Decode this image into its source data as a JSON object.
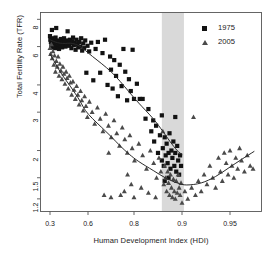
{
  "chart_data": {
    "type": "scatter",
    "title": "",
    "xlabel": "Human Development Index (HDI)",
    "ylabel": "Total Fertility Rate (TFR)",
    "x_ticks": [
      0.3,
      0.6,
      0.8,
      0.9,
      0.95
    ],
    "x_tick_labels": [
      "0.3",
      "0.6",
      "0.8",
      "0.9",
      "0.95"
    ],
    "y_ticks": [
      8,
      6,
      4,
      3,
      2,
      1.5,
      1.2
    ],
    "y_tick_labels": [
      "8",
      "6",
      "4",
      "3",
      "2",
      "1.5",
      "1.2"
    ],
    "y_scale": "log",
    "xlim": [
      0.26,
      0.98
    ],
    "ylim": [
      1.05,
      8.6
    ],
    "grid": false,
    "legend_position": "top-right",
    "highlight_band": {
      "label": "HDI 0.86 - 0.90 transition zone",
      "x_start": 0.858,
      "x_end": 0.902,
      "color": "#d9d9d9"
    },
    "series": [
      {
        "name": "1975",
        "marker": "square",
        "color": "#121212",
        "points": [
          [
            0.3,
            6.7
          ],
          [
            0.303,
            6.45
          ],
          [
            0.307,
            6.3
          ],
          [
            0.311,
            6.05
          ],
          [
            0.315,
            7.15
          ],
          [
            0.318,
            6.2
          ],
          [
            0.322,
            5.95
          ],
          [
            0.327,
            6.55
          ],
          [
            0.331,
            6.35
          ],
          [
            0.335,
            6.1
          ],
          [
            0.339,
            5.9
          ],
          [
            0.344,
            6.6
          ],
          [
            0.349,
            7.3
          ],
          [
            0.353,
            6.25
          ],
          [
            0.357,
            6.0
          ],
          [
            0.362,
            6.4
          ],
          [
            0.366,
            6.15
          ],
          [
            0.371,
            5.85
          ],
          [
            0.376,
            6.3
          ],
          [
            0.381,
            6.05
          ],
          [
            0.386,
            6.5
          ],
          [
            0.391,
            6.2
          ],
          [
            0.396,
            5.95
          ],
          [
            0.401,
            6.35
          ],
          [
            0.406,
            6.1
          ],
          [
            0.411,
            6.55
          ],
          [
            0.417,
            6.25
          ],
          [
            0.422,
            6.0
          ],
          [
            0.428,
            6.4
          ],
          [
            0.433,
            6.15
          ],
          [
            0.439,
            7.05
          ],
          [
            0.445,
            6.3
          ],
          [
            0.451,
            6.05
          ],
          [
            0.457,
            6.45
          ],
          [
            0.463,
            6.2
          ],
          [
            0.469,
            5.9
          ],
          [
            0.475,
            6.35
          ],
          [
            0.482,
            6.6
          ],
          [
            0.488,
            6.1
          ],
          [
            0.495,
            6.25
          ],
          [
            0.502,
            5.8
          ],
          [
            0.509,
            6.45
          ],
          [
            0.516,
            6.15
          ],
          [
            0.523,
            5.95
          ],
          [
            0.53,
            6.3
          ],
          [
            0.538,
            6.0
          ],
          [
            0.546,
            6.55
          ],
          [
            0.554,
            5.75
          ],
          [
            0.562,
            6.2
          ],
          [
            0.57,
            5.9
          ],
          [
            0.578,
            6.4
          ],
          [
            0.587,
            4.55
          ],
          [
            0.596,
            6.05
          ],
          [
            0.605,
            5.7
          ],
          [
            0.614,
            6.25
          ],
          [
            0.623,
            4.2
          ],
          [
            0.633,
            5.85
          ],
          [
            0.643,
            6.3
          ],
          [
            0.653,
            4.55
          ],
          [
            0.663,
            5.6
          ],
          [
            0.674,
            6.45
          ],
          [
            0.685,
            4.0
          ],
          [
            0.696,
            5.4
          ],
          [
            0.7,
            4.7
          ],
          [
            0.707,
            3.85
          ],
          [
            0.714,
            5.2
          ],
          [
            0.722,
            4.4
          ],
          [
            0.73,
            3.55
          ],
          [
            0.738,
            4.95
          ],
          [
            0.746,
            3.95
          ],
          [
            0.754,
            5.85
          ],
          [
            0.762,
            4.6
          ],
          [
            0.77,
            3.4
          ],
          [
            0.778,
            4.25
          ],
          [
            0.786,
            3.75
          ],
          [
            0.794,
            5.8
          ],
          [
            0.8,
            3.45
          ],
          [
            0.806,
            4.05
          ],
          [
            0.812,
            3.45
          ],
          [
            0.818,
            3.45
          ],
          [
            0.824,
            2.8
          ],
          [
            0.83,
            3.1
          ],
          [
            0.836,
            2.45
          ],
          [
            0.842,
            2.2
          ],
          [
            0.846,
            2.6
          ],
          [
            0.85,
            1.95
          ],
          [
            0.854,
            2.35
          ],
          [
            0.858,
            1.8
          ],
          [
            0.86,
            2.05
          ],
          [
            0.862,
            1.7
          ],
          [
            0.864,
            2.3
          ],
          [
            0.866,
            1.9
          ],
          [
            0.868,
            2.15
          ],
          [
            0.87,
            1.75
          ],
          [
            0.872,
            1.95
          ],
          [
            0.874,
            2.4
          ],
          [
            0.876,
            1.65
          ],
          [
            0.878,
            2.0
          ],
          [
            0.88,
            1.85
          ],
          [
            0.882,
            2.2
          ],
          [
            0.884,
            1.7
          ],
          [
            0.886,
            1.95
          ],
          [
            0.888,
            1.6
          ],
          [
            0.89,
            2.1
          ],
          [
            0.892,
            1.8
          ],
          [
            0.894,
            1.55
          ],
          [
            0.896,
            1.9
          ],
          [
            0.898,
            1.7
          ],
          [
            0.886,
            2.85
          ],
          [
            0.864,
            1.45
          ],
          [
            0.872,
            1.5
          ],
          [
            0.858,
            2.9
          ],
          [
            0.84,
            2.75
          ]
        ]
      },
      {
        "name": "2005",
        "marker": "triangle",
        "color": "#4a4a4a",
        "points": [
          [
            0.3,
            5.9
          ],
          [
            0.305,
            5.55
          ],
          [
            0.311,
            6.15
          ],
          [
            0.317,
            5.3
          ],
          [
            0.323,
            5.7
          ],
          [
            0.33,
            4.95
          ],
          [
            0.336,
            5.45
          ],
          [
            0.343,
            4.6
          ],
          [
            0.35,
            5.15
          ],
          [
            0.357,
            4.85
          ],
          [
            0.364,
            5.4
          ],
          [
            0.371,
            4.4
          ],
          [
            0.378,
            5.0
          ],
          [
            0.386,
            4.65
          ],
          [
            0.394,
            4.25
          ],
          [
            0.402,
            4.85
          ],
          [
            0.41,
            4.5
          ],
          [
            0.418,
            4.05
          ],
          [
            0.427,
            4.6
          ],
          [
            0.435,
            4.3
          ],
          [
            0.444,
            3.85
          ],
          [
            0.453,
            4.4
          ],
          [
            0.462,
            4.1
          ],
          [
            0.471,
            3.6
          ],
          [
            0.481,
            4.15
          ],
          [
            0.49,
            3.8
          ],
          [
            0.5,
            3.45
          ],
          [
            0.51,
            3.95
          ],
          [
            0.52,
            3.6
          ],
          [
            0.53,
            3.25
          ],
          [
            0.541,
            3.75
          ],
          [
            0.551,
            3.4
          ],
          [
            0.562,
            3.05
          ],
          [
            0.573,
            3.55
          ],
          [
            0.584,
            3.2
          ],
          [
            0.595,
            2.85
          ],
          [
            0.606,
            3.35
          ],
          [
            0.618,
            3.0
          ],
          [
            0.629,
            2.65
          ],
          [
            0.641,
            3.15
          ],
          [
            0.653,
            2.8
          ],
          [
            0.665,
            2.45
          ],
          [
            0.677,
            2.95
          ],
          [
            0.689,
            2.6
          ],
          [
            0.701,
            2.3
          ],
          [
            0.713,
            2.75
          ],
          [
            0.725,
            2.4
          ],
          [
            0.737,
            2.1
          ],
          [
            0.749,
            2.55
          ],
          [
            0.76,
            2.25
          ],
          [
            0.771,
            1.95
          ],
          [
            0.782,
            2.35
          ],
          [
            0.792,
            2.05
          ],
          [
            0.801,
            1.8
          ],
          [
            0.81,
            2.15
          ],
          [
            0.818,
            1.9
          ],
          [
            0.826,
            1.65
          ],
          [
            0.834,
            2.0
          ],
          [
            0.841,
            1.75
          ],
          [
            0.847,
            1.5
          ],
          [
            0.852,
            1.85
          ],
          [
            0.856,
            1.6
          ],
          [
            0.86,
            2.45
          ],
          [
            0.862,
            1.4
          ],
          [
            0.864,
            1.7
          ],
          [
            0.866,
            1.5
          ],
          [
            0.868,
            1.3
          ],
          [
            0.87,
            1.6
          ],
          [
            0.872,
            1.42
          ],
          [
            0.874,
            1.25
          ],
          [
            0.876,
            1.55
          ],
          [
            0.878,
            1.35
          ],
          [
            0.88,
            1.22
          ],
          [
            0.882,
            1.48
          ],
          [
            0.884,
            1.3
          ],
          [
            0.886,
            1.2
          ],
          [
            0.888,
            1.45
          ],
          [
            0.89,
            1.28
          ],
          [
            0.892,
            1.55
          ],
          [
            0.894,
            1.35
          ],
          [
            0.896,
            1.25
          ],
          [
            0.898,
            1.42
          ],
          [
            0.9,
            1.15
          ],
          [
            0.903,
            1.3
          ],
          [
            0.906,
            1.2
          ],
          [
            0.91,
            1.35
          ],
          [
            0.912,
            2.85
          ],
          [
            0.914,
            1.25
          ],
          [
            0.917,
            1.45
          ],
          [
            0.92,
            1.3
          ],
          [
            0.923,
            1.55
          ],
          [
            0.926,
            1.4
          ],
          [
            0.929,
            1.7
          ],
          [
            0.932,
            1.5
          ],
          [
            0.935,
            1.35
          ],
          [
            0.938,
            1.85
          ],
          [
            0.94,
            1.6
          ],
          [
            0.942,
            1.45
          ],
          [
            0.944,
            1.95
          ],
          [
            0.946,
            1.75
          ],
          [
            0.948,
            1.55
          ],
          [
            0.95,
            2.0
          ],
          [
            0.952,
            1.7
          ],
          [
            0.954,
            1.5
          ],
          [
            0.956,
            1.85
          ],
          [
            0.958,
            1.65
          ],
          [
            0.96,
            2.05
          ],
          [
            0.962,
            1.8
          ],
          [
            0.965,
            1.6
          ],
          [
            0.968,
            1.9
          ],
          [
            0.971,
            1.7
          ],
          [
            0.974,
            1.65
          ],
          [
            0.845,
            1.22
          ],
          [
            0.83,
            1.28
          ],
          [
            0.815,
            1.35
          ],
          [
            0.8,
            1.22
          ],
          [
            0.788,
            1.4
          ],
          [
            0.772,
            1.55
          ],
          [
            0.758,
            1.3
          ],
          [
            0.742,
            1.25
          ],
          [
            0.7,
            1.22
          ],
          [
            0.69,
            1.95
          ],
          [
            0.67,
            1.25
          ]
        ]
      }
    ],
    "trend_curves": [
      {
        "series": "1975",
        "type": "loess",
        "points": [
          [
            0.3,
            6.45
          ],
          [
            0.34,
            6.3
          ],
          [
            0.38,
            6.22
          ],
          [
            0.42,
            6.2
          ],
          [
            0.46,
            6.22
          ],
          [
            0.5,
            6.15
          ],
          [
            0.54,
            6.0
          ],
          [
            0.58,
            5.75
          ],
          [
            0.62,
            5.4
          ],
          [
            0.66,
            5.0
          ],
          [
            0.7,
            4.6
          ],
          [
            0.74,
            4.15
          ],
          [
            0.78,
            3.7
          ],
          [
            0.81,
            3.3
          ],
          [
            0.84,
            2.8
          ],
          [
            0.86,
            2.45
          ],
          [
            0.875,
            2.2
          ],
          [
            0.89,
            2.0
          ],
          [
            0.9,
            1.92
          ]
        ]
      },
      {
        "series": "2005",
        "type": "loess",
        "points": [
          [
            0.3,
            5.55
          ],
          [
            0.34,
            5.05
          ],
          [
            0.38,
            4.6
          ],
          [
            0.42,
            4.25
          ],
          [
            0.46,
            3.95
          ],
          [
            0.5,
            3.65
          ],
          [
            0.54,
            3.35
          ],
          [
            0.58,
            3.05
          ],
          [
            0.62,
            2.8
          ],
          [
            0.66,
            2.55
          ],
          [
            0.7,
            2.32
          ],
          [
            0.74,
            2.1
          ],
          [
            0.78,
            1.92
          ],
          [
            0.81,
            1.78
          ],
          [
            0.84,
            1.62
          ],
          [
            0.865,
            1.5
          ],
          [
            0.89,
            1.42
          ],
          [
            0.905,
            1.39
          ],
          [
            0.92,
            1.42
          ],
          [
            0.935,
            1.52
          ],
          [
            0.95,
            1.68
          ],
          [
            0.962,
            1.82
          ],
          [
            0.975,
            1.98
          ]
        ]
      }
    ],
    "legend": [
      {
        "label": "1975",
        "marker": "square",
        "color": "#121212"
      },
      {
        "label": "2005",
        "marker": "triangle",
        "color": "#4a4a4a"
      }
    ]
  }
}
